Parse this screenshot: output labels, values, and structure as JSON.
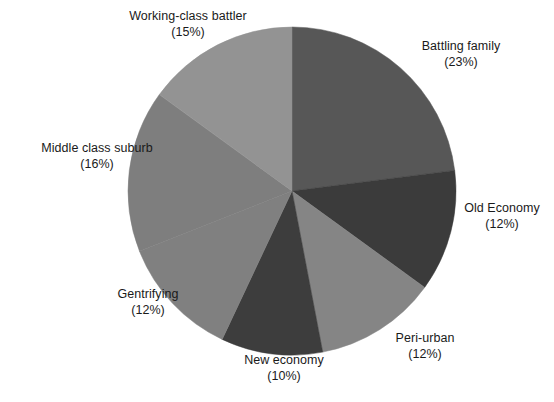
{
  "chart_data": {
    "type": "pie",
    "title": "",
    "subtitle": "",
    "xlabel": "",
    "ylabel": "",
    "legend_position": "none",
    "grid": false,
    "label_format": "name on first line, (percent) on second line",
    "start_angle_deg": 0,
    "direction": "clockwise",
    "categories": [
      "Battling family",
      "Old Economy",
      "Peri-urban",
      "New economy",
      "Gentrifying",
      "Middle class suburb",
      "Working-class battler"
    ],
    "values": [
      23,
      12,
      12,
      10,
      12,
      16,
      15
    ],
    "value_labels": [
      "(23%)",
      "(12%)",
      "(12%)",
      "(10%)",
      "(12%)",
      "(16%)",
      "(15%)"
    ],
    "units": "percent",
    "total": 100,
    "colors": [
      "#575757",
      "#3b3b3b",
      "#858585",
      "#3d3d3d",
      "#808080",
      "#7e7e7e",
      "#939393"
    ],
    "slices": [
      {
        "label": "Battling family",
        "percent": 23,
        "percent_label": "(23%)",
        "color": "#575757"
      },
      {
        "label": "Old Economy",
        "percent": 12,
        "percent_label": "(12%)",
        "color": "#3b3b3b"
      },
      {
        "label": "Peri-urban",
        "percent": 12,
        "percent_label": "(12%)",
        "color": "#858585"
      },
      {
        "label": "New economy",
        "percent": 10,
        "percent_label": "(10%)",
        "color": "#3d3d3d"
      },
      {
        "label": "Gentrifying",
        "percent": 12,
        "percent_label": "(12%)",
        "color": "#808080"
      },
      {
        "label": "Middle class suburb",
        "percent": 16,
        "percent_label": "(16%)",
        "color": "#7e7e7e"
      },
      {
        "label": "Working-class battler",
        "percent": 15,
        "percent_label": "(15%)",
        "color": "#939393"
      }
    ],
    "geometry": {
      "center_x": 292,
      "center_y": 191,
      "radius": 164
    },
    "background_color": "#ffffff",
    "text_color": "#1a1a1a"
  }
}
